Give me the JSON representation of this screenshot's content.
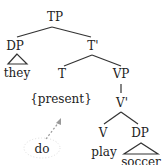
{
  "tree": {
    "nodes": {
      "TP": "TP",
      "DP_subj": "DP",
      "they": "they",
      "T_bar": "T'",
      "T": "T",
      "present": "{present}",
      "VP": "VP",
      "V_bar": "V'",
      "V": "V",
      "play": "play",
      "DP_obj": "DP",
      "soccer": "soccer"
    },
    "moved_element": "do",
    "arrow_style": "dotted",
    "line_color": "#333333",
    "arrow_color": "#999999"
  }
}
